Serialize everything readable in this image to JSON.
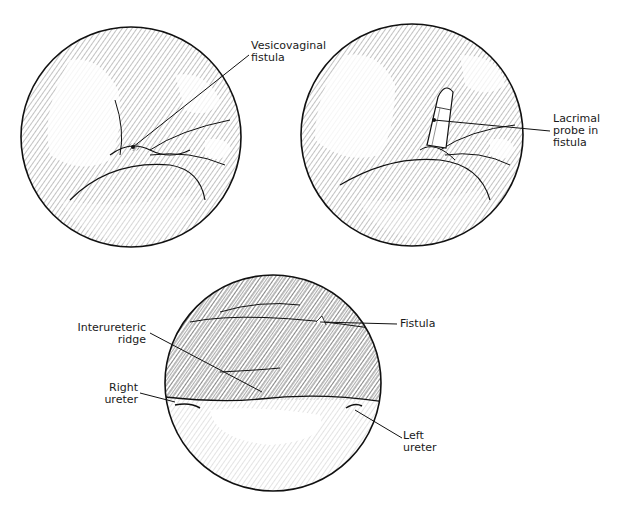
{
  "figure": {
    "colors": {
      "ink": "#1a1a1a",
      "background": "#ffffff",
      "hatch": "#555555"
    },
    "panels": [
      {
        "id": "top-left",
        "center": [
          131,
          137
        ],
        "radius": 110,
        "labels": [
          {
            "id": "vesicovaginal-fistula",
            "lines": [
              "Vesicovaginal",
              "fistula"
            ]
          }
        ]
      },
      {
        "id": "top-right",
        "center": [
          412,
          135
        ],
        "radius": 111,
        "labels": [
          {
            "id": "lacrimal-probe",
            "lines": [
              "Lacrimal",
              "probe in",
              "fistula"
            ]
          }
        ]
      },
      {
        "id": "bottom",
        "center": [
          273,
          383
        ],
        "radius": 108,
        "labels": [
          {
            "id": "fistula",
            "lines": [
              "Fistula"
            ]
          },
          {
            "id": "interureteric-ridge",
            "lines": [
              "Interureteric",
              "ridge"
            ]
          },
          {
            "id": "right-ureter",
            "lines": [
              "Right",
              "ureter"
            ]
          },
          {
            "id": "left-ureter",
            "lines": [
              "Left",
              "ureter"
            ]
          }
        ]
      }
    ]
  }
}
